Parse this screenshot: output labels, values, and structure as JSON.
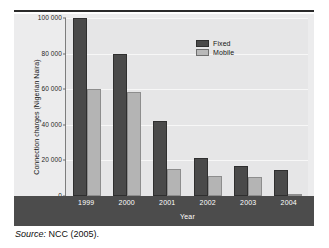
{
  "figure": {
    "source_prefix": "Source:",
    "source_text": " NCC (2005)."
  },
  "colors": {
    "fixed": "#4a4a4a",
    "mobile": "#b4b4b4",
    "panel_bg": "#e6e6e7",
    "axis_band": "#4c4c4c",
    "gridline": "#f7f7f7"
  },
  "chart_data": {
    "type": "bar",
    "title": "",
    "xlabel": "Year",
    "ylabel": "Connection charges (Nigerian Naira)",
    "categories": [
      "1999",
      "2000",
      "2001",
      "2002",
      "2003",
      "2004"
    ],
    "series": [
      {
        "name": "Fixed",
        "color": "#4a4a4a",
        "values": [
          100000,
          80000,
          42000,
          21500,
          17000,
          14500
        ]
      },
      {
        "name": "Mobile",
        "color": "#b4b4b4",
        "values": [
          60000,
          58500,
          15000,
          11500,
          10500,
          500
        ]
      }
    ],
    "ylim": [
      0,
      100000
    ],
    "yticks": [
      0,
      20000,
      40000,
      60000,
      80000,
      100000
    ],
    "ytick_labels": [
      "0",
      "20 000",
      "40 000",
      "60 000",
      "80 000",
      "100 000"
    ],
    "grid": true,
    "legend": {
      "position": "top-right",
      "entries": [
        "Fixed",
        "Mobile"
      ]
    }
  }
}
